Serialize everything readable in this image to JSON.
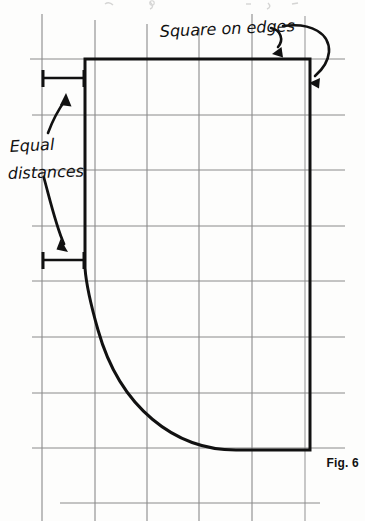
{
  "figure": {
    "caption": "Fig. 6",
    "annotations": [
      {
        "id": "square-on-edges",
        "text": "Square on edges",
        "style": "handwritten",
        "position": {
          "x": 160,
          "y": 22
        },
        "points_to": "top-right-corner-of-rectangle"
      },
      {
        "id": "equal-distances",
        "text": "Equal distances",
        "lines": [
          "Equal",
          "distances"
        ],
        "style": "handwritten",
        "position": {
          "x": 10,
          "y": 124
        },
        "points_to": "two-dimension-markers"
      }
    ],
    "dimension_markers": [
      {
        "id": "upper-equal-distance",
        "x1": 42,
        "x2": 85,
        "y": 78
      },
      {
        "id": "lower-equal-distance",
        "x1": 42,
        "x2": 85,
        "y": 260
      }
    ],
    "outline": {
      "id": "profile-outline",
      "description": "Rectangular block with lower-left corner replaced by a concave fillet curve",
      "top_left": {
        "x": 85,
        "y": 59
      },
      "top_right": {
        "x": 310,
        "y": 59
      },
      "right_bottom": {
        "x": 310,
        "y": 450
      },
      "curve_start": {
        "x": 85,
        "y": 268
      },
      "curve_end": {
        "x": 310,
        "y": 450
      },
      "stroke_color": "#111111",
      "stroke_width": 3
    },
    "grid": {
      "visible": true,
      "stroke_color": "#8d8d8d",
      "stroke_width": 1,
      "vertical_lines_x": [
        42,
        95,
        147,
        199,
        252,
        305
      ],
      "horizontal_lines_y": [
        59,
        115,
        170,
        226,
        281,
        337,
        393,
        448,
        503
      ],
      "vertical_extent": {
        "y1": 12,
        "y2": 521
      },
      "horizontal_extent": {
        "x1": 30,
        "x2": 345
      }
    },
    "colors": {
      "background": "#fdfdfc",
      "ink": "#111111",
      "grid": "#8d8d8d",
      "faint_grid": "#c3c3c3"
    }
  }
}
